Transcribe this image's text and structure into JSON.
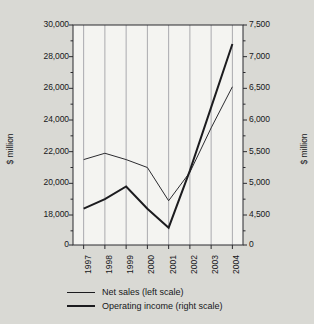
{
  "chart_data": {
    "type": "line",
    "title": "",
    "subtitle": "",
    "xlabel": "",
    "ylabel": "$ million",
    "ylabel_right": "$ million",
    "grid": true,
    "grid_orientation": "vertical",
    "legend_position": "bottom",
    "categories": [
      "1997",
      "1998",
      "1999",
      "2000",
      "2001",
      "2002",
      "2003",
      "2004"
    ],
    "x": [
      1997,
      1998,
      1999,
      2000,
      2001,
      2002,
      2003,
      2004
    ],
    "axes": {
      "left": {
        "label": "$ million",
        "ticks": [
          "30,000",
          "28,000",
          "26,000",
          "24,000",
          "22,000",
          "20,000",
          "18,000",
          "0"
        ],
        "tick_values": [
          30000,
          28000,
          26000,
          24000,
          22000,
          20000,
          18000,
          0
        ],
        "ylim": [
          17000,
          30000
        ],
        "broken_axis": true,
        "zero_label": "0",
        "minor_ticks": true
      },
      "right": {
        "label": "$ million",
        "ticks": [
          "7,500",
          "7,000",
          "6,500",
          "6,000",
          "5,500",
          "5,000",
          "4,500",
          "0"
        ],
        "tick_values": [
          7500,
          7000,
          6500,
          6000,
          5500,
          5000,
          4500,
          0
        ],
        "ylim": [
          4250,
          7500
        ],
        "broken_axis": true,
        "zero_label": "0",
        "minor_ticks": true
      }
    },
    "series": [
      {
        "name": "Net sales (left scale)",
        "scale": "left",
        "color": "#2b2b2f",
        "stroke_width": 1,
        "values": [
          21500,
          21900,
          21500,
          21000,
          18900,
          20700,
          23500,
          26100
        ]
      },
      {
        "name": "Operating income (right scale)",
        "scale": "right",
        "color": "#1c1c1f",
        "stroke_width": 2,
        "values": [
          4600,
          4750,
          4950,
          4600,
          4300,
          5200,
          6200,
          7200
        ]
      }
    ],
    "legend": [
      {
        "label": "Net sales (left scale)",
        "style": "thin"
      },
      {
        "label": "Operating income (right scale)",
        "style": "thick"
      }
    ],
    "colors": {
      "background": "#d9d9d4",
      "plot_background": "#f4f4f1",
      "axis": "#2b2b2f",
      "gridline": "#aaaaae",
      "text": "#17171a"
    }
  }
}
